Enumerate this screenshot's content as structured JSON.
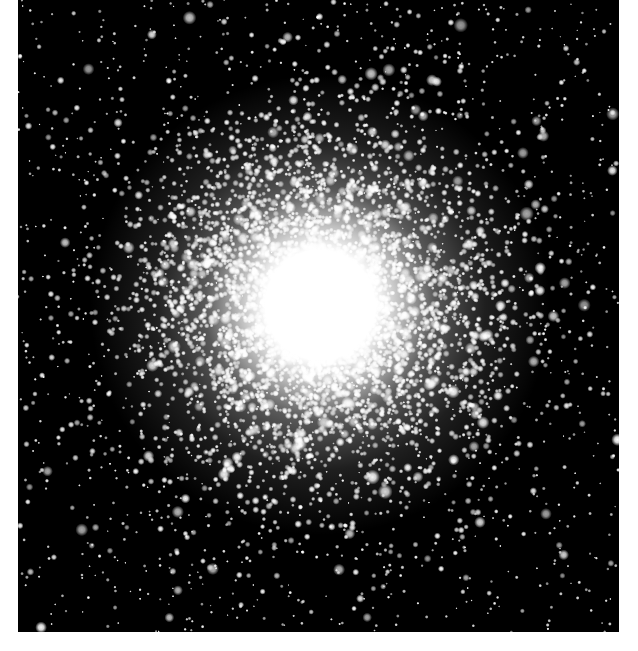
{
  "image": {
    "subject": "globular star cluster",
    "background_color": "#000000",
    "border_color": "#ffffff",
    "frame": {
      "x": 18,
      "y": 0,
      "width": 601,
      "height": 632
    },
    "core": {
      "cx": 302,
      "cy": 305,
      "solid_radius": 55,
      "halo_radius": 230
    },
    "star_color": "#ffffff",
    "field_star_count": 1400,
    "cluster_star_count": 5200
  }
}
